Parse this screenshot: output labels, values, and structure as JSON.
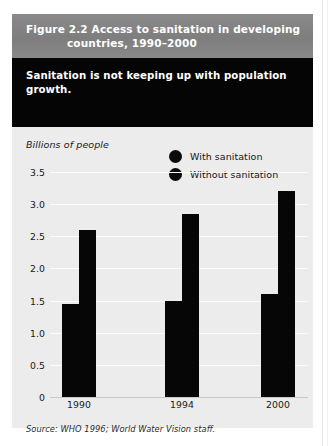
{
  "figure": {
    "title_line1": "Figure 2.2 Access to sanitation in developing",
    "title_line2": "countries, 1990–2000",
    "subtitle": "Sanitation is not keeping up with population growth.",
    "source": "Source: WHO 1996; World Water Vision staff.",
    "band_color": "#838383",
    "subtitle_band_color": "#050505",
    "plot_background": "#ececec",
    "bar_color": "#060606"
  },
  "legend": {
    "items": [
      {
        "label": "With sanitation",
        "marker": "filled-circle",
        "color": "#0b0b0b"
      },
      {
        "label": "Without sanitation",
        "marker": "filled-circle",
        "color": "#0b0b0b"
      }
    ]
  },
  "chart_data": {
    "type": "bar",
    "title": "Access to sanitation in developing countries, 1990–2000",
    "xlabel": "",
    "ylabel": "Billions of people",
    "categories": [
      "1990",
      "1994",
      "2000"
    ],
    "series": [
      {
        "name": "With sanitation",
        "values": [
          1.45,
          1.5,
          1.6
        ]
      },
      {
        "name": "Without sanitation",
        "values": [
          2.6,
          2.85,
          3.2
        ]
      }
    ],
    "ylim": [
      0,
      3.5
    ],
    "yticks": [
      "3.5",
      "3.0",
      "2.5",
      "2.0",
      "1.5",
      "1.0",
      "0.5",
      "0"
    ],
    "ytick_values": [
      3.5,
      3.0,
      2.5,
      2.0,
      1.5,
      1.0,
      0.5,
      0
    ],
    "grid": true,
    "legend_position": "top-right"
  }
}
